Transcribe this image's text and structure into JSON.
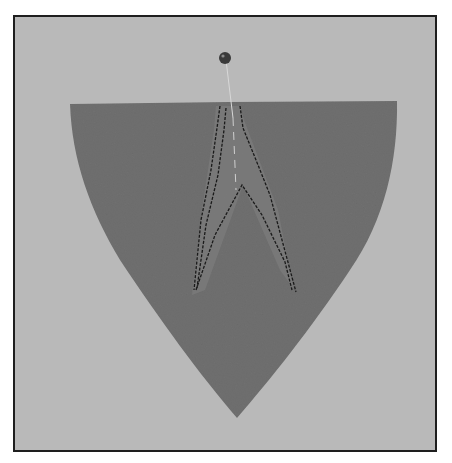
{
  "image": {
    "subject": "gray felt shield-shaped piece with stitched dart and straight pin",
    "colors": {
      "background": "#b9b9b9",
      "felt": "#6f6f6f",
      "felt_dark": "#5e5e5e",
      "stitch": "#1a1a1a",
      "frame": "#1e1e1e",
      "pin_head": "#3a3a3a"
    }
  }
}
